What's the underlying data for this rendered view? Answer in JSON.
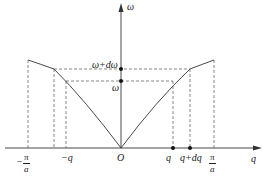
{
  "diagram": {
    "type": "dispersion-relation",
    "axes": {
      "x_label": "q",
      "y_label": "ω",
      "origin_label": "O"
    },
    "x_ticks": {
      "neg_pi_over_a": {
        "sign": "−",
        "num": "π",
        "den": "a"
      },
      "neg_q": "−q",
      "q": "q",
      "q_plus_dq": "q+dq",
      "pi_over_a": {
        "num": "π",
        "den": "a"
      }
    },
    "y_ticks": {
      "omega": "ω",
      "omega_plus_domega": "ω+dω"
    },
    "colors": {
      "line": "#333333",
      "dashed": "#555555",
      "background": "#ffffff"
    },
    "caption": ""
  }
}
